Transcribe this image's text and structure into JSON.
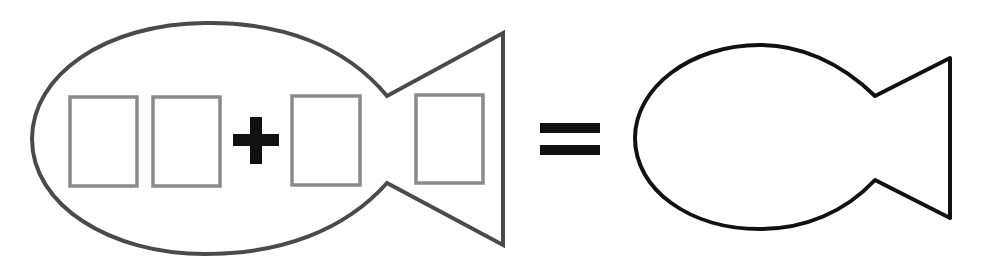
{
  "diagram": {
    "left_fish": {
      "outline_color": "#4a4a4a",
      "boxes": [
        {
          "id": "tens_digit_1",
          "value": ""
        },
        {
          "id": "ones_digit_1",
          "value": ""
        },
        {
          "id": "addend_2",
          "value": ""
        },
        {
          "id": "tail_box",
          "value": ""
        }
      ],
      "box_color": "#8a8a8a"
    },
    "operator": "+",
    "equals": "=",
    "right_fish": {
      "outline_color": "#111111",
      "answer": ""
    },
    "symbol_color": "#111111"
  }
}
